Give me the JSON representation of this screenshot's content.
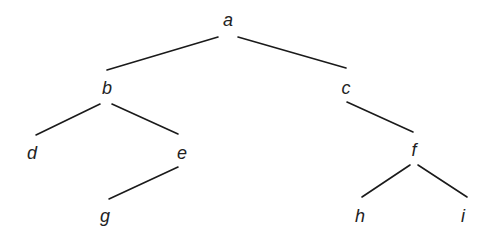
{
  "diagram": {
    "type": "tree",
    "root": "a",
    "nodes": [
      {
        "id": "a",
        "label": "a",
        "x": 228,
        "y": 20
      },
      {
        "id": "b",
        "label": "b",
        "x": 107,
        "y": 88
      },
      {
        "id": "c",
        "label": "c",
        "x": 346,
        "y": 88
      },
      {
        "id": "d",
        "label": "d",
        "x": 32,
        "y": 153
      },
      {
        "id": "e",
        "label": "e",
        "x": 182,
        "y": 153
      },
      {
        "id": "f",
        "label": "f",
        "x": 414,
        "y": 150
      },
      {
        "id": "g",
        "label": "g",
        "x": 105,
        "y": 216
      },
      {
        "id": "h",
        "label": "h",
        "x": 360,
        "y": 216
      },
      {
        "id": "i",
        "label": "i",
        "x": 463,
        "y": 216
      }
    ],
    "edges": [
      {
        "from": "a",
        "to": "b",
        "x1": 218,
        "y1": 37,
        "x2": 107,
        "y2": 70
      },
      {
        "from": "a",
        "to": "c",
        "x1": 238,
        "y1": 37,
        "x2": 346,
        "y2": 68
      },
      {
        "from": "b",
        "to": "d",
        "x1": 100,
        "y1": 104,
        "x2": 36,
        "y2": 135
      },
      {
        "from": "b",
        "to": "e",
        "x1": 112,
        "y1": 104,
        "x2": 178,
        "y2": 134
      },
      {
        "from": "e",
        "to": "g",
        "x1": 178,
        "y1": 167,
        "x2": 109,
        "y2": 199
      },
      {
        "from": "c",
        "to": "f",
        "x1": 347,
        "y1": 102,
        "x2": 413,
        "y2": 132
      },
      {
        "from": "f",
        "to": "h",
        "x1": 410,
        "y1": 165,
        "x2": 362,
        "y2": 197
      },
      {
        "from": "f",
        "to": "i",
        "x1": 418,
        "y1": 165,
        "x2": 467,
        "y2": 197
      }
    ]
  }
}
